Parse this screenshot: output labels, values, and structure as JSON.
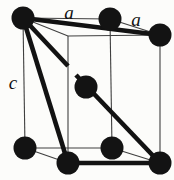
{
  "figure": {
    "kind": "crystal-unit-cell-diagram",
    "labels": {
      "top_edge": "a",
      "side_edge": "a",
      "vertical_edge": "c"
    },
    "colors": {
      "background": "#fcfcfa",
      "thin_line": "#3f3f3f",
      "thick_line": "#121212",
      "atom": "#131313",
      "label": "#101010"
    },
    "atom_radius": 11.5,
    "atoms": [
      {
        "name": "atom-top-back-left",
        "x": 23,
        "y": 18
      },
      {
        "name": "atom-top-back-right",
        "x": 110,
        "y": 19
      },
      {
        "name": "atom-top-front-right",
        "x": 160,
        "y": 35
      },
      {
        "name": "atom-body-center",
        "x": 86,
        "y": 87
      },
      {
        "name": "atom-bottom-back-left",
        "x": 25,
        "y": 148
      },
      {
        "name": "atom-bottom-back-right",
        "x": 112,
        "y": 148
      },
      {
        "name": "atom-bottom-front-left",
        "x": 68,
        "y": 163
      },
      {
        "name": "atom-bottom-front-right",
        "x": 160,
        "y": 163
      }
    ],
    "thin_edges": [
      {
        "name": "top-back-edge",
        "x1": 23,
        "y1": 18,
        "x2": 110,
        "y2": 19
      },
      {
        "name": "top-right-depth-edge",
        "x1": 110,
        "y1": 19,
        "x2": 160,
        "y2": 35
      },
      {
        "name": "top-front-edge",
        "x1": 68,
        "y1": 36,
        "x2": 160,
        "y2": 35
      },
      {
        "name": "top-left-depth-edge",
        "x1": 23,
        "y1": 18,
        "x2": 68,
        "y2": 36
      },
      {
        "name": "left-back-vertical-edge",
        "x1": 23,
        "y1": 18,
        "x2": 25,
        "y2": 148
      },
      {
        "name": "right-back-vertical-edge",
        "x1": 110,
        "y1": 19,
        "x2": 112,
        "y2": 148
      },
      {
        "name": "left-front-vertical-edge",
        "x1": 68,
        "y1": 36,
        "x2": 68,
        "y2": 163
      },
      {
        "name": "right-front-vertical-edge",
        "x1": 160,
        "y1": 35,
        "x2": 160,
        "y2": 163
      },
      {
        "name": "bottom-back-edge",
        "x1": 25,
        "y1": 148,
        "x2": 112,
        "y2": 148
      },
      {
        "name": "bottom-right-depth-edge",
        "x1": 112,
        "y1": 148,
        "x2": 160,
        "y2": 163
      },
      {
        "name": "bottom-left-depth-edge",
        "x1": 25,
        "y1": 148,
        "x2": 68,
        "y2": 163
      }
    ],
    "thick_edges": [
      {
        "name": "top-diagonal-bond",
        "x1": 23,
        "y1": 18,
        "x2": 160,
        "y2": 35
      },
      {
        "name": "left-diagonal-bond",
        "x1": 23,
        "y1": 18,
        "x2": 68,
        "y2": 163
      },
      {
        "name": "body-diagonal-bond-upper",
        "x1": 23,
        "y1": 18,
        "x2": 68,
        "y2": 66
      },
      {
        "name": "body-diagonal-bond-lower",
        "x1": 76,
        "y1": 75,
        "x2": 160,
        "y2": 163
      },
      {
        "name": "bottom-front-bond",
        "x1": 68,
        "y1": 163,
        "x2": 160,
        "y2": 163
      }
    ]
  }
}
